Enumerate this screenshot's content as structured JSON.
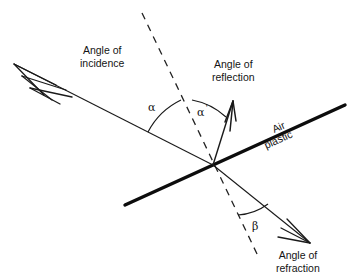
{
  "diagram": {
    "labels": {
      "angle_of_incidence": "Angle of\nincidence",
      "angle_of_incidence_line1": "Angle of",
      "angle_of_incidence_line2": "incidence",
      "angle_of_reflection_line1": "Angle of",
      "angle_of_reflection_line2": "reflection",
      "angle_of_refraction_line1": "Angle of",
      "angle_of_refraction_line2": "refraction",
      "medium_upper": "Air",
      "medium_lower": "plastic",
      "alpha": "α",
      "alpha_prime_base": "α",
      "alpha_prime_mark": "'",
      "beta": "β"
    },
    "colors": {
      "background": "#ffffff",
      "ink": "#141414",
      "interface_line": "#0d0d0d",
      "ray_line": "#1a1a1a",
      "normal_dashed": "#222222",
      "arc": "#1a1a1a"
    },
    "geometry": {
      "intersection_point": {
        "x": 213,
        "y": 165
      },
      "interface_line": {
        "x1": 125,
        "y1": 205,
        "x2": 345,
        "y2": 105,
        "stroke_width": 3.4
      },
      "normal_dashed": {
        "x1": 142,
        "y1": 13,
        "x2": 258,
        "y2": 256,
        "dash": "7 6",
        "stroke_width": 1.3
      },
      "incident_ray": {
        "x1": 14,
        "y1": 64,
        "x2": 213,
        "y2": 165,
        "stroke_width": 1.1,
        "arrow": "feathered-multi-barb",
        "arrow_at": "x1"
      },
      "reflected_ray": {
        "x1": 213,
        "y1": 165,
        "x2": 233,
        "y2": 101,
        "stroke_width": 1.3,
        "arrow": "feathered-multi-barb",
        "arrow_at": "x2"
      },
      "refracted_ray": {
        "x1": 213,
        "y1": 165,
        "x2": 310,
        "y2": 243,
        "stroke_width": 1.1,
        "arrow": "feathered-multi-barb",
        "arrow_at": "x2"
      },
      "arc_alpha": {
        "radius": 73,
        "from_deg": 207,
        "to_deg": 244
      },
      "arc_alpha_prime": {
        "radius": 68,
        "from_deg": 252,
        "to_deg": 287
      },
      "arc_beta": {
        "radius": 56,
        "from_deg": 64,
        "to_deg": 39
      }
    },
    "angles": {
      "alpha_name": "angle of incidence",
      "alpha_prime_name": "angle of reflection",
      "beta_name": "angle of refraction"
    }
  }
}
